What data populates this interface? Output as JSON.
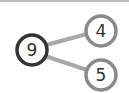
{
  "diagram": {
    "type": "number-bond",
    "whole": {
      "value": "9",
      "stroke": "#333333"
    },
    "parts": [
      {
        "value": "4",
        "stroke": "#8a8a8a"
      },
      {
        "value": "5",
        "stroke": "#8a8a8a"
      }
    ],
    "connector_color": "#a8a8a8",
    "text_color": "#333333"
  }
}
